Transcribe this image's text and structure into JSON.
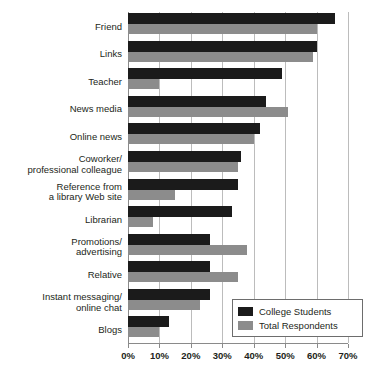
{
  "chart_data": {
    "type": "bar",
    "orientation": "horizontal",
    "title": "",
    "subtitle": "",
    "xlabel": "",
    "ylabel": "",
    "xlim": [
      0,
      70
    ],
    "xtick_labels": [
      "0%",
      "10%",
      "20%",
      "30%",
      "40%",
      "50%",
      "60%",
      "70%"
    ],
    "xtick_values": [
      0,
      10,
      20,
      30,
      40,
      50,
      60,
      70
    ],
    "grid": true,
    "legend_position": "bottom-right",
    "categories": [
      "Friend",
      "Links",
      "Teacher",
      "News media",
      "Online news",
      "Coworker/\nprofessional colleague",
      "Reference from\na library Web site",
      "Librarian",
      "Promotions/\nadvertising",
      "Relative",
      "Instant messaging/\nonline chat",
      "Blogs"
    ],
    "series": [
      {
        "name": "College Students",
        "color": "#1b1b1b",
        "values": [
          66,
          60,
          49,
          44,
          42,
          36,
          35,
          33,
          26,
          26,
          26,
          13
        ]
      },
      {
        "name": "Total Respondents",
        "color": "#8c8c8c",
        "values": [
          60,
          59,
          10,
          51,
          40,
          35,
          15,
          8,
          38,
          35,
          23,
          10
        ]
      }
    ]
  },
  "legend": {
    "items": [
      {
        "label": "College Students",
        "swatch": "dark"
      },
      {
        "label": "Total Respondents",
        "swatch": "light"
      }
    ]
  }
}
